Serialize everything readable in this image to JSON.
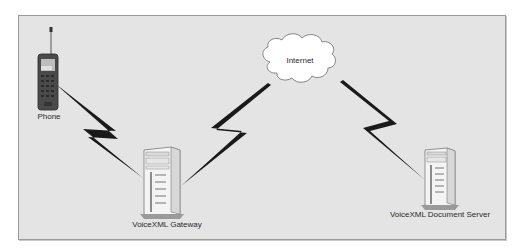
{
  "diagram": {
    "nodes": {
      "phone": {
        "label": "Phone",
        "type": "mobile-phone"
      },
      "gateway": {
        "label": "VoiceXML Gateway",
        "type": "server-tower"
      },
      "internet": {
        "label": "Internet",
        "type": "cloud"
      },
      "doc_server": {
        "label": "VoiceXML Document Server",
        "type": "server-tower"
      }
    },
    "links": [
      {
        "from": "Phone",
        "to": "VoiceXML Gateway",
        "style": "wireless-lightning"
      },
      {
        "from": "VoiceXML Gateway",
        "to": "Internet",
        "style": "lightning"
      },
      {
        "from": "Internet",
        "to": "VoiceXML Document Server",
        "style": "lightning"
      }
    ],
    "colors": {
      "background": "#e4e4e4",
      "border": "#9a9a9a",
      "bolt": "#1a1a1a",
      "cloud": "#ffffff"
    }
  }
}
